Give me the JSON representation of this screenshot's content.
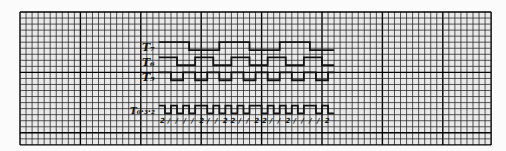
{
  "figure": {
    "colors": {
      "paper": "#fbfbfb",
      "grid_minor": "#2a2a2a",
      "grid_major": "#000000",
      "ink": "#111111"
    },
    "grid": {
      "columns": 78,
      "rows": 22,
      "major_every": 10
    },
    "signals": [
      {
        "label": "T₇",
        "bits": [
          1,
          1,
          1,
          1,
          1,
          0,
          0,
          0,
          0,
          0,
          1,
          1,
          1,
          1,
          1,
          0,
          0,
          0,
          0,
          0,
          1,
          1,
          1,
          1,
          1,
          0,
          0,
          0,
          0
        ]
      },
      {
        "label": "T₆",
        "bits": [
          1,
          1,
          1,
          0,
          0,
          0,
          1,
          1,
          1,
          0,
          0,
          0,
          1,
          1,
          1,
          0,
          0,
          0,
          1,
          1,
          1,
          0,
          0,
          0,
          1,
          1,
          1,
          0,
          0
        ]
      },
      {
        "label": "T₅",
        "bits": [
          1,
          1,
          0,
          0,
          1,
          1,
          0,
          0,
          1,
          1,
          0,
          0,
          1,
          1,
          0,
          0,
          1,
          1,
          0,
          0,
          1,
          1,
          0,
          0,
          1,
          1,
          0,
          0,
          1
        ]
      },
      {
        "label": "T₀·₃·₂",
        "bits": [
          1,
          0,
          1,
          0,
          1,
          0,
          1,
          1,
          0,
          1,
          0,
          1,
          0,
          1,
          0,
          1,
          1,
          0,
          1,
          0,
          1,
          0,
          1,
          0,
          1,
          1,
          0,
          1,
          0
        ]
      }
    ],
    "tick_marks": [
      "2",
      "/",
      "/",
      "/",
      "/",
      "2",
      "/",
      "/",
      "2",
      "2",
      "/",
      "/",
      "2",
      "2",
      "/",
      "/",
      "2",
      "/",
      "/",
      "/",
      "/",
      "2"
    ]
  }
}
